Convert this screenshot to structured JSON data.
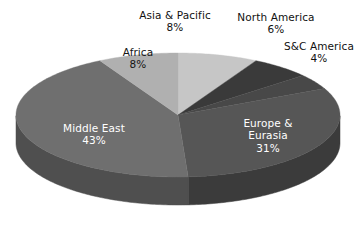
{
  "chart_data": {
    "type": "pie",
    "title": "",
    "subtitle": "",
    "xlabel": "",
    "ylabel": "",
    "legend": "none",
    "grid": false,
    "units": "percent",
    "total": 100,
    "three_d": true,
    "start_angle_deg": 90,
    "direction": "clockwise",
    "categories": [
      "Asia & Pacific",
      "North America",
      "S&C America",
      "Europe & Eurasia",
      "Middle East",
      "Africa"
    ],
    "values": [
      8,
      6,
      4,
      31,
      43,
      8
    ],
    "slices": [
      {
        "label": "Asia & Pacific",
        "value": 8,
        "value_text": "8%",
        "color": "#c6c6c6",
        "side_color": "#9c9c9c",
        "label_position": "outside",
        "label_color": "#111111"
      },
      {
        "label": "North America",
        "value": 6,
        "value_text": "6%",
        "color": "#3a3a3a",
        "side_color": "#2a2a2a",
        "label_position": "outside",
        "label_color": "#111111"
      },
      {
        "label": "S&C America",
        "value": 4,
        "value_text": "4%",
        "color": "#484848",
        "side_color": "#333333",
        "label_position": "outside",
        "label_color": "#111111"
      },
      {
        "label": "Europe & Eurasia",
        "value": 31,
        "value_text": "31%",
        "color": "#565656",
        "side_color": "#3b3b3b",
        "label_position": "inside",
        "label_color": "#ffffff"
      },
      {
        "label": "Middle East",
        "value": 43,
        "value_text": "43%",
        "color": "#6f6f6f",
        "side_color": "#4f4f4f",
        "label_position": "inside",
        "label_color": "#ffffff"
      },
      {
        "label": "Africa",
        "value": 8,
        "value_text": "8%",
        "color": "#b0b0b0",
        "side_color": "#8a8a8a",
        "label_position": "inside",
        "label_color": "#151515"
      }
    ],
    "background_color": "#ffffff"
  },
  "labels": {
    "asia_pacific": {
      "name": "Asia & Pacific",
      "percent": "8%"
    },
    "north_america": {
      "name": "North America",
      "percent": "6%"
    },
    "sc_america": {
      "name": "S&C America",
      "percent": "4%"
    },
    "europe_eurasia": {
      "name": "Europe &",
      "name2": "Eurasia",
      "percent": "31%"
    },
    "middle_east": {
      "name": "Middle East",
      "percent": "43%"
    },
    "africa": {
      "name": "Africa",
      "percent": "8%"
    }
  }
}
